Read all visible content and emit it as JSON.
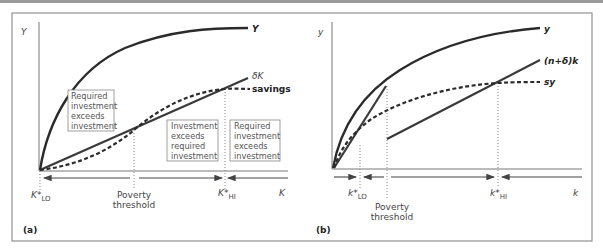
{
  "figure": {
    "panels": [
      {
        "id": "a",
        "panel_label": "(a)",
        "y_axis_label": "Y",
        "x_axis_label": "K",
        "curves": [
          {
            "name": "output",
            "label": "Y",
            "style": "solid"
          },
          {
            "name": "depreciation",
            "label": "δK",
            "style": "solid"
          },
          {
            "name": "savings",
            "label": "savings",
            "style": "dashed"
          }
        ],
        "ticks": [
          {
            "label": "K*",
            "sub": "LO"
          },
          {
            "label": "Poverty",
            "label2": "threshold"
          },
          {
            "label": "K*",
            "sub": "HI"
          }
        ],
        "boxes": [
          {
            "lines": [
              "Required",
              "investment",
              "exceeds",
              "investment"
            ]
          },
          {
            "lines": [
              "Investment",
              "exceeds",
              "required",
              "investment"
            ]
          },
          {
            "lines": [
              "Required",
              "investment",
              "exceeds",
              "investment"
            ]
          }
        ]
      },
      {
        "id": "b",
        "panel_label": "(b)",
        "y_axis_label": "y",
        "x_axis_label": "k",
        "curves": [
          {
            "name": "output-per-worker",
            "label": "y",
            "style": "solid"
          },
          {
            "name": "required-investment",
            "label": "(n+δ)k",
            "style": "solid"
          },
          {
            "name": "savings-per-worker",
            "label": "sy",
            "style": "dashed"
          }
        ],
        "ticks": [
          {
            "label": "k*",
            "sub": "LO"
          },
          {
            "label": "Poverty",
            "label2": "threshold"
          },
          {
            "label": "k*",
            "sub": "HI"
          }
        ]
      }
    ]
  }
}
